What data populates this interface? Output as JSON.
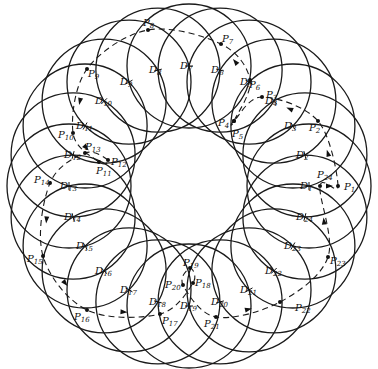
{
  "figure": {
    "center": [
      189,
      186
    ],
    "ring_radius": 120,
    "disk_radius": 62,
    "disks": [
      {
        "label": "D",
        "sub": "1"
      },
      {
        "label": "D",
        "sub": "2"
      },
      {
        "label": "D",
        "sub": "3"
      },
      {
        "label": "D",
        "sub": "4"
      },
      {
        "label": "D",
        "sub": "5"
      },
      {
        "label": "D",
        "sub": "6"
      },
      {
        "label": "D",
        "sub": "7"
      },
      {
        "label": "D",
        "sub": "8"
      },
      {
        "label": "D",
        "sub": "9"
      },
      {
        "label": "D",
        "sub": "10"
      },
      {
        "label": "D",
        "sub": "11"
      },
      {
        "label": "D",
        "sub": "12"
      },
      {
        "label": "D",
        "sub": "13"
      },
      {
        "label": "D",
        "sub": "14"
      },
      {
        "label": "D",
        "sub": "15"
      },
      {
        "label": "D",
        "sub": "16"
      },
      {
        "label": "D",
        "sub": "17"
      },
      {
        "label": "D",
        "sub": "18"
      },
      {
        "label": "D",
        "sub": "19"
      },
      {
        "label": "D",
        "sub": "20"
      },
      {
        "label": "D",
        "sub": "21"
      },
      {
        "label": "D",
        "sub": "22"
      },
      {
        "label": "D",
        "sub": "23"
      },
      {
        "label": "D",
        "sub": "24"
      }
    ],
    "points": [
      {
        "label": "P",
        "sub": "1",
        "x": 338,
        "y": 186,
        "lx": 344,
        "ly": 190
      },
      {
        "label": "P",
        "sub": "2",
        "x": 318,
        "y": 121,
        "lx": 309,
        "ly": 131
      },
      {
        "label": "P",
        "sub": "3",
        "x": 262,
        "y": 97,
        "lx": 266,
        "ly": 98
      },
      {
        "label": "P",
        "sub": "4",
        "x": 234,
        "y": 121,
        "lx": 218,
        "ly": 126
      },
      {
        "label": "P",
        "sub": "5",
        "x": 234,
        "y": 121,
        "lx": 232,
        "ly": 137
      },
      {
        "label": "P",
        "sub": "6",
        "x": 250,
        "y": 80,
        "lx": 249,
        "ly": 88
      },
      {
        "label": "P",
        "sub": "7",
        "x": 221,
        "y": 44,
        "lx": 222,
        "ly": 42
      },
      {
        "label": "P",
        "sub": "8",
        "x": 148,
        "y": 30,
        "lx": 143,
        "ly": 26
      },
      {
        "label": "P",
        "sub": "9",
        "x": 87,
        "y": 69,
        "lx": 88,
        "ly": 77
      },
      {
        "label": "P",
        "sub": "10",
        "x": 73,
        "y": 133,
        "lx": 58,
        "ly": 138
      },
      {
        "label": "P",
        "sub": "11",
        "x": 99,
        "y": 162,
        "lx": 96,
        "ly": 174
      },
      {
        "label": "P",
        "sub": "12",
        "x": 108,
        "y": 160,
        "lx": 111,
        "ly": 165
      },
      {
        "label": "P",
        "sub": "13",
        "x": 85,
        "y": 153,
        "lx": 85,
        "ly": 150
      },
      {
        "label": "P",
        "sub": "14",
        "x": 50,
        "y": 183,
        "lx": 34,
        "ly": 183
      },
      {
        "label": "P",
        "sub": "15",
        "x": 43,
        "y": 256,
        "lx": 27,
        "ly": 262
      },
      {
        "label": "P",
        "sub": "16",
        "x": 87,
        "y": 310,
        "lx": 74,
        "ly": 320
      },
      {
        "label": "P",
        "sub": "17",
        "x": 160,
        "y": 314,
        "lx": 162,
        "ly": 324
      },
      {
        "label": "P",
        "sub": "18",
        "x": 193,
        "y": 283,
        "lx": 195,
        "ly": 286
      },
      {
        "label": "P",
        "sub": "19",
        "x": 190,
        "y": 268,
        "lx": 183,
        "ly": 266
      },
      {
        "label": "P",
        "sub": "20",
        "x": 183,
        "y": 285,
        "lx": 165,
        "ly": 288
      },
      {
        "label": "P",
        "sub": "21",
        "x": 216,
        "y": 317,
        "lx": 204,
        "ly": 327
      },
      {
        "label": "P",
        "sub": "22",
        "x": 280,
        "y": 302,
        "lx": 295,
        "ly": 311
      },
      {
        "label": "P",
        "sub": "23",
        "x": 328,
        "y": 257,
        "lx": 330,
        "ly": 264
      },
      {
        "label": "P",
        "sub": "24",
        "x": 320,
        "y": 186,
        "lx": 317,
        "ly": 178
      }
    ]
  }
}
